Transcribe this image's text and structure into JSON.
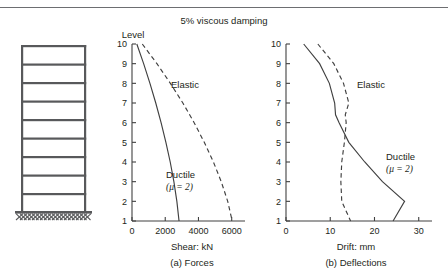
{
  "page": {
    "cut_off_line": "",
    "title": "5% viscous damping"
  },
  "frame_diagram": {
    "name": "ten-storey-shear-frame",
    "stories": 10,
    "floor_lines": 9,
    "base_hatch": true
  },
  "chart_data": [
    {
      "type": "line",
      "id": "forces",
      "title": "",
      "caption": "(a) Forces",
      "xlabel": "Shear: kN",
      "ylabel": "Level",
      "ylabel_position": "above-axis",
      "xticks": [
        0,
        2000,
        4000,
        6000
      ],
      "xtick_labels": [
        "0",
        "2000",
        "4000",
        "6000"
      ],
      "yticks": [
        1,
        2,
        3,
        4,
        5,
        6,
        7,
        8,
        9,
        10
      ],
      "ytick_labels": [
        "1",
        "2",
        "3",
        "4",
        "5",
        "6",
        "7",
        "8",
        "9",
        "10"
      ],
      "xlim": [
        0,
        6800
      ],
      "ylim": [
        1,
        10
      ],
      "grid": false,
      "legend": "inline-annotations",
      "series": [
        {
          "name": "Ductile",
          "label": "Ductile",
          "sublabel": "(μ = 2)",
          "style": "solid",
          "color": "#404040",
          "y": [
            10,
            9,
            8,
            7,
            6,
            5,
            4,
            3,
            2,
            1
          ],
          "values": [
            290,
            700,
            1080,
            1430,
            1750,
            2040,
            2300,
            2520,
            2700,
            2830
          ]
        },
        {
          "name": "Elastic",
          "label": "Elastic",
          "style": "dashed",
          "color": "#404040",
          "y": [
            10,
            9,
            8,
            7,
            6,
            5,
            4,
            3,
            2,
            1
          ],
          "values": [
            620,
            1500,
            2310,
            3060,
            3740,
            4350,
            4900,
            5370,
            5760,
            6030
          ]
        }
      ]
    },
    {
      "type": "line",
      "id": "deflections",
      "title": "",
      "caption": "(b) Deflections",
      "xlabel": "Drift: mm",
      "ylabel": "",
      "xticks": [
        0,
        10,
        20,
        30
      ],
      "xtick_labels": [
        "0",
        "10",
        "20",
        "30"
      ],
      "yticks": [
        1,
        2,
        3,
        4,
        5,
        6,
        7,
        8,
        9,
        10
      ],
      "ytick_labels": [
        "1",
        "2",
        "3",
        "4",
        "5",
        "6",
        "7",
        "8",
        "9",
        "10"
      ],
      "xlim": [
        0,
        33
      ],
      "ylim": [
        1,
        10
      ],
      "grid": false,
      "legend": "inline-annotations",
      "series": [
        {
          "name": "Ductile",
          "label": "Ductile",
          "sublabel": "(μ = 2)",
          "style": "solid",
          "color": "#404040",
          "y": [
            10,
            9,
            8,
            7,
            6.4,
            6,
            5,
            4,
            3,
            2,
            1
          ],
          "values": [
            4.0,
            7.6,
            9.8,
            11.0,
            11.2,
            12.0,
            14.2,
            17.8,
            21.8,
            26.8,
            24.2
          ]
        },
        {
          "name": "Elastic",
          "label": "Elastic",
          "style": "dashed",
          "color": "#404040",
          "y": [
            10,
            9,
            8,
            7,
            6.4,
            6,
            5,
            4,
            3,
            2,
            1
          ],
          "values": [
            7.2,
            10.8,
            13.0,
            14.2,
            13.4,
            13.6,
            13.2,
            12.6,
            12.4,
            12.6,
            14.6
          ]
        }
      ]
    }
  ]
}
